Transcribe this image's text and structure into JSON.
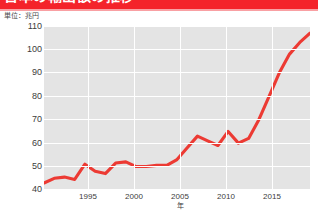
{
  "banner": {
    "title": "日本の輸出額の推移",
    "background_color": "#f4232a",
    "text_color": "#ffffff"
  },
  "unit_label": "単位：兆円",
  "axis": {
    "y_ticks": [
      "110",
      "100",
      "90",
      "80",
      "70",
      "60",
      "50",
      "40"
    ],
    "x_ticks": [
      "1995",
      "2000",
      "2005",
      "2010",
      "2015"
    ],
    "x_axis_name": "年"
  },
  "colors": {
    "line": "#ec3a33",
    "plot_background": "#e4e4e4",
    "gridline": "#ffffff",
    "banner": "#f4232a"
  },
  "chart_data": {
    "type": "line",
    "title": "日本の輸出額の推移",
    "xlabel": "年",
    "ylabel": "兆円",
    "unit": "単位：兆円",
    "xlim": [
      1992,
      2018
    ],
    "ylim": [
      40,
      110
    ],
    "ytick_values": [
      40,
      50,
      60,
      70,
      80,
      90,
      100,
      110
    ],
    "xtick_values": [
      1995,
      2000,
      2005,
      2010,
      2015
    ],
    "grid": true,
    "legend": false,
    "series": [
      {
        "name": "輸出額",
        "color": "#ec3a33",
        "x": [
          1992,
          1993,
          1994,
          1995,
          1996,
          1997,
          1998,
          1999,
          2000,
          2001,
          2002,
          2003,
          2004,
          2005,
          2006,
          2007,
          2008,
          2009,
          2010,
          2011,
          2012,
          2013,
          2014,
          2015,
          2016,
          2017,
          2018
        ],
        "values": [
          43,
          45,
          45.5,
          44.5,
          51,
          48,
          47,
          51.5,
          52,
          50,
          50,
          50.5,
          50.5,
          53,
          58,
          63,
          61,
          59,
          65,
          60,
          62,
          70,
          80,
          90,
          98,
          103,
          107
        ]
      }
    ]
  }
}
